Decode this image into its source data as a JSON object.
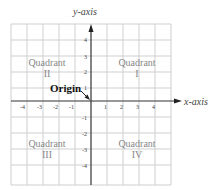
{
  "diagram": {
    "y_axis_label": "y-axis",
    "x_axis_label": "x-axis",
    "origin_label": "Origin",
    "quadrants": [
      {
        "word": "Quadrant",
        "numeral": "I"
      },
      {
        "word": "Quadrant",
        "numeral": "II"
      },
      {
        "word": "Quadrant",
        "numeral": "III"
      },
      {
        "word": "Quadrant",
        "numeral": "IV"
      }
    ],
    "x_ticks": [
      "-4",
      "-3",
      "-2",
      "-1",
      "1",
      "2",
      "3",
      "4"
    ],
    "y_ticks": [
      "4",
      "3",
      "2",
      "1",
      "-1",
      "-2",
      "-3",
      "-4"
    ],
    "grid_range": [
      -5,
      5
    ],
    "colors": {
      "grid": "#c8c8c8",
      "axis": "#333333",
      "text": "#888888"
    }
  }
}
